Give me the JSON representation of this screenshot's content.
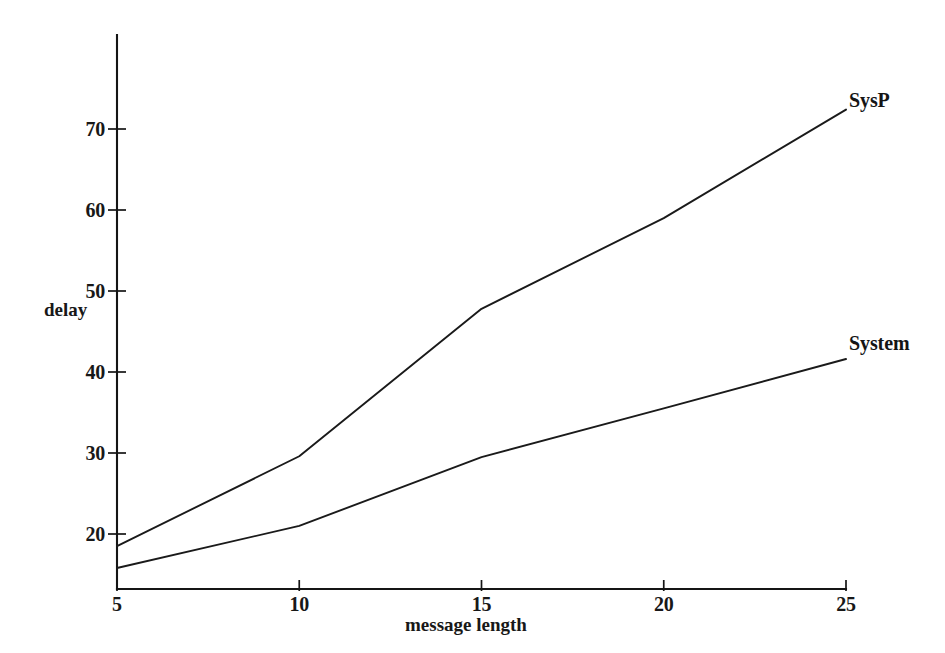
{
  "chart_data": {
    "type": "line",
    "title": "",
    "xlabel": "message length",
    "ylabel": "delay",
    "xlim": [
      5,
      25
    ],
    "ylim": [
      13.6,
      75.5
    ],
    "xticks": [
      5,
      10,
      15,
      20,
      25
    ],
    "xtick_labels": [
      "5",
      "10",
      "15",
      "20",
      "25"
    ],
    "yticks": [
      20,
      30,
      40,
      50,
      60,
      70
    ],
    "ytick_labels": [
      "20",
      "30",
      "40",
      "50",
      "60",
      "70"
    ],
    "grid": false,
    "legend": "inline-end-labels",
    "series": [
      {
        "name": "SysP",
        "label": "SysP",
        "color": "#1a1a1a",
        "x": [
          5,
          10,
          15,
          20,
          25
        ],
        "values": [
          18.5,
          29.6,
          47.8,
          59.0,
          72.4
        ]
      },
      {
        "name": "System",
        "label": "System",
        "color": "#1a1a1a",
        "x": [
          5,
          10,
          15,
          20,
          25
        ],
        "values": [
          15.8,
          21.0,
          29.5,
          35.5,
          41.6
        ]
      }
    ],
    "annotations": [
      {
        "text": "SysP",
        "x": 25,
        "y": 73.5
      },
      {
        "text": "System",
        "x": 25,
        "y": 43.5
      }
    ]
  },
  "axes": {
    "y_axis_label": "delay",
    "x_axis_label": "message length"
  }
}
